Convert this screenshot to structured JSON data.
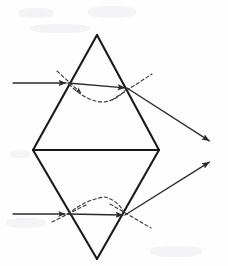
{
  "figure": {
    "background_color": "#fefeff",
    "stroke_color": "#1a1a1a",
    "ray_color": "#2b2b2b",
    "dash_color": "#3a3a3a",
    "width": 228,
    "height": 266
  },
  "prism": {
    "label": "double-prism-rhombus",
    "top_apex": {
      "x": 97,
      "y": 35
    },
    "left_vertex": {
      "x": 33,
      "y": 150
    },
    "right_vertex": {
      "x": 159,
      "y": 150
    },
    "bottom_apex": {
      "x": 97,
      "y": 259
    },
    "midline": {
      "x1": 33,
      "y1": 150,
      "x2": 159,
      "y2": 150
    }
  },
  "rays": {
    "upper": {
      "name": "upper-light-ray",
      "incoming": {
        "x1": 13,
        "y1": 83,
        "x2": 68,
        "y2": 83
      },
      "internal": {
        "x1": 68,
        "y1": 83,
        "x2": 127,
        "y2": 88
      },
      "outgoing": {
        "x1": 127,
        "y1": 88,
        "x2": 211,
        "y2": 142
      },
      "entry_point": {
        "x": 68,
        "y": 83
      },
      "exit_point": {
        "x": 127,
        "y": 88
      }
    },
    "lower": {
      "name": "lower-light-ray",
      "incoming": {
        "x1": 13,
        "y1": 214,
        "x2": 67,
        "y2": 214
      },
      "internal": {
        "x1": 67,
        "y1": 214,
        "x2": 125,
        "y2": 215
      },
      "outgoing": {
        "x1": 125,
        "y1": 215,
        "x2": 211,
        "y2": 161
      },
      "entry_point": {
        "x": 67,
        "y": 214
      },
      "exit_point": {
        "x": 125,
        "y": 215
      }
    }
  },
  "normals": {
    "upper_entry": {
      "x1": 57,
      "y1": 71,
      "x2": 81,
      "y2": 93
    },
    "upper_exit": {
      "x1": 112,
      "y1": 100,
      "x2": 152,
      "y2": 74
    },
    "lower_entry": {
      "x1": 52,
      "y1": 222,
      "x2": 86,
      "y2": 205
    },
    "lower_exit": {
      "x1": 110,
      "y1": 204,
      "x2": 151,
      "y2": 228
    }
  },
  "guides": {
    "upper_arc": {
      "description": "dashed V dip between entry and exit",
      "points": "68,83 84,98 105,102 127,88"
    },
    "lower_arc": {
      "description": "dashed arch above lower internal ray",
      "points": "67,214 84,201 105,197 125,215"
    }
  },
  "icons": {
    "arrowhead": "arrow-head-marker"
  }
}
